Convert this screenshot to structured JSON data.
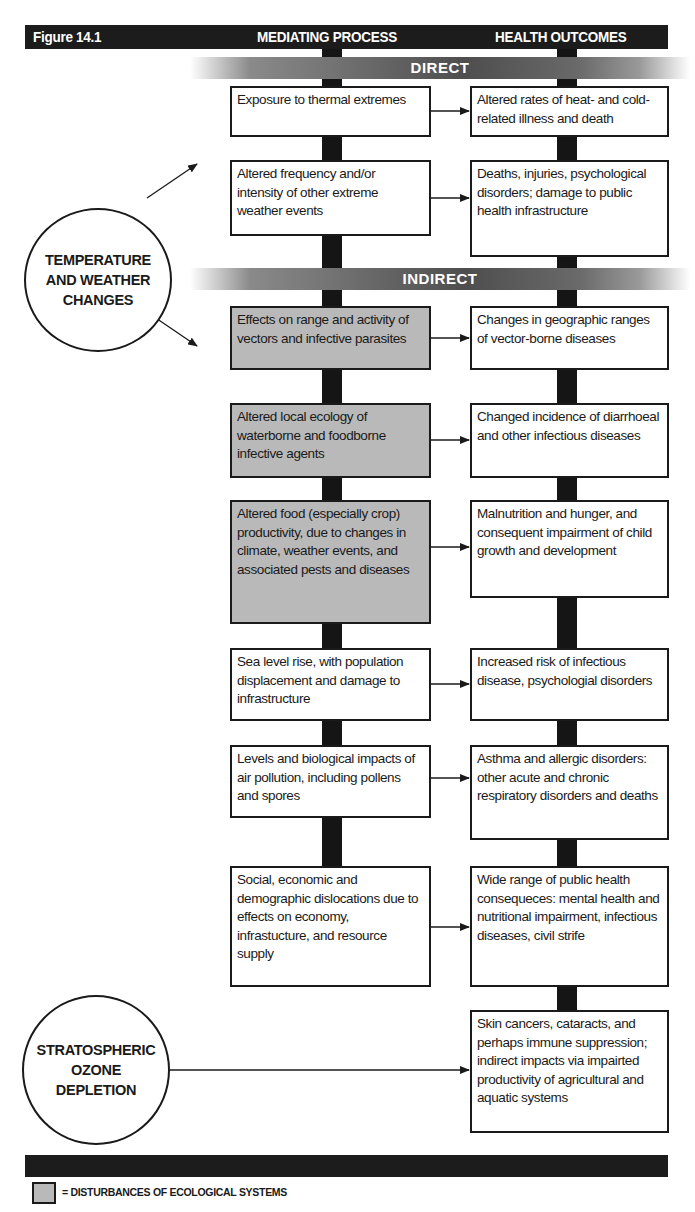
{
  "figure": {
    "label": "Figure 14.1",
    "column_headers": [
      "MEDIATING PROCESS",
      "HEALTH OUTCOMES"
    ],
    "sections": {
      "direct": "DIRECT",
      "indirect": "INDIRECT"
    },
    "sources": {
      "temperature": "TEMPERATURE AND WEATHER CHANGES",
      "temperature_lines": [
        "TEMPERATURE",
        "AND WEATHER",
        "CHANGES"
      ],
      "ozone": "STRATOSPHERIC OZONE DEPLETION",
      "ozone_lines": [
        "STRATOSPHERIC",
        "OZONE",
        "DEPLETION"
      ]
    },
    "mediating_processes": [
      {
        "text": "Exposure to thermal extremes",
        "ecological": false
      },
      {
        "text": "Altered frequency and/or intensity of other extreme weather events",
        "ecological": false
      },
      {
        "text": "Effects on range and activity of vectors and infective parasites",
        "ecological": true
      },
      {
        "text": "Altered local ecology of waterborne and foodborne infective agents",
        "ecological": true
      },
      {
        "text": "Altered food (especially crop) productivity, due to changes in climate, weather events, and associated pests and diseases",
        "ecological": true
      },
      {
        "text": "Sea level rise, with population displacement and damage to infrastructure",
        "ecological": false
      },
      {
        "text": "Levels and biological impacts of air pollution, including pollens and spores",
        "ecological": false
      },
      {
        "text": "Social, economic and demographic dislocations due to effects on economy, infrastucture, and resource supply",
        "ecological": false
      }
    ],
    "health_outcomes": [
      "Altered rates of heat- and cold-related illness and death",
      "Deaths, injuries, psychological disorders; damage to public health infrastructure",
      "Changes in geographic ranges of vector-borne diseases",
      "Changed incidence of diarrhoeal and other infectious diseases",
      "Malnutrition and hunger, and consequent impairment of child growth and development",
      "Increased risk of infectious disease, psychologial disorders",
      "Asthma and allergic disorders: other acute and chronic respiratory disorders and deaths",
      "Wide range of public health consequeces: mental health and nutritional impairment, infectious diseases, civil strife",
      "Skin cancers, cataracts, and perhaps immune suppression; indirect impacts via impairted productivity of agricultural and aquatic systems"
    ],
    "legend": {
      "text": "= DISTURBANCES OF ECOLOGICAL SYSTEMS"
    },
    "colors": {
      "bar": "#1c1c1c",
      "ecological_fill": "#b9b9b9",
      "box_border": "#1a1a1a"
    }
  }
}
